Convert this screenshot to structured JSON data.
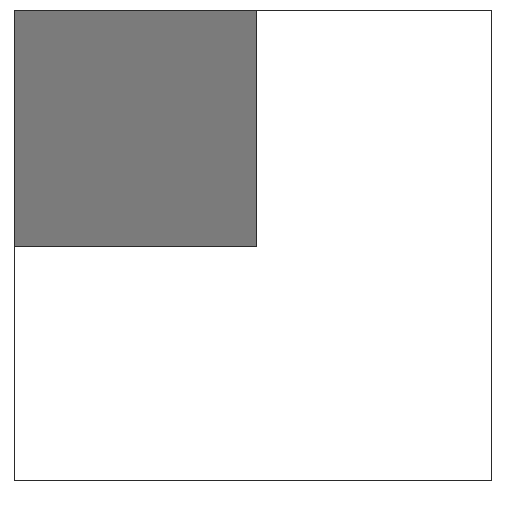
{
  "diagram": {
    "shapes": [
      {
        "id": "outer-square",
        "type": "square",
        "fill": "#ffffff",
        "stroke": "#2a2a2a",
        "x": 14,
        "y": 10,
        "width": 478,
        "height": 471
      },
      {
        "id": "inner-square",
        "type": "square",
        "fill": "#7b7b7b",
        "stroke": "#2a2a2a",
        "x": 14,
        "y": 10,
        "width": 243,
        "height": 237,
        "fraction_of_outer": "1/4"
      }
    ],
    "colors": {
      "background": "#ffffff",
      "outline": "#2a2a2a",
      "fill": "#7b7b7b"
    }
  }
}
